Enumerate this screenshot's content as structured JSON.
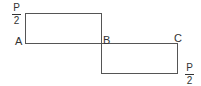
{
  "diagram": {
    "type": "shear-force-diagram",
    "points": [
      {
        "id": "A",
        "label": "A"
      },
      {
        "id": "B",
        "label": "B"
      },
      {
        "id": "C",
        "label": "C"
      }
    ],
    "segments": [
      {
        "from": "A",
        "to": "B",
        "value_label": {
          "numerator": "P",
          "denominator": "2"
        },
        "sign": "positive"
      },
      {
        "from": "B",
        "to": "C",
        "value_label": {
          "numerator": "P",
          "denominator": "2"
        },
        "sign": "negative"
      }
    ],
    "line_color": "#555555"
  }
}
